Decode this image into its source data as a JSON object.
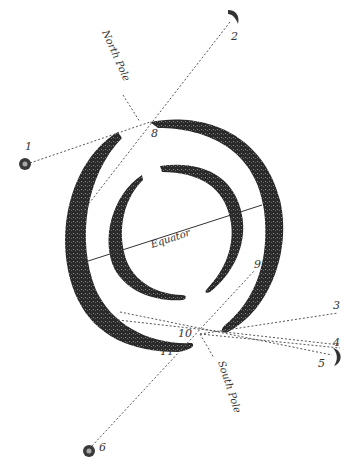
{
  "diagram": {
    "type": "astronomical-illustration",
    "labels": {
      "north_pole": "North Pole",
      "south_pole": "South Pole",
      "equator": "Equator"
    },
    "points": [
      {
        "id": "1",
        "label": "1",
        "marker": "sun"
      },
      {
        "id": "2",
        "label": "2",
        "marker": "crescent"
      },
      {
        "id": "3",
        "label": "3",
        "marker": "none"
      },
      {
        "id": "4",
        "label": "4",
        "marker": "none"
      },
      {
        "id": "5",
        "label": "5",
        "marker": "crescent"
      },
      {
        "id": "6",
        "label": "6",
        "marker": "sun"
      },
      {
        "id": "7",
        "label": "7",
        "marker": "none"
      },
      {
        "id": "8",
        "label": "8",
        "marker": "none"
      },
      {
        "id": "9",
        "label": "9",
        "marker": "none"
      },
      {
        "id": "10",
        "label": "10",
        "marker": "none"
      },
      {
        "id": "11",
        "label": "11",
        "marker": "none"
      }
    ],
    "colors": {
      "ring": "#2a2a2a",
      "line": "#555555",
      "background": "#ffffff"
    }
  }
}
